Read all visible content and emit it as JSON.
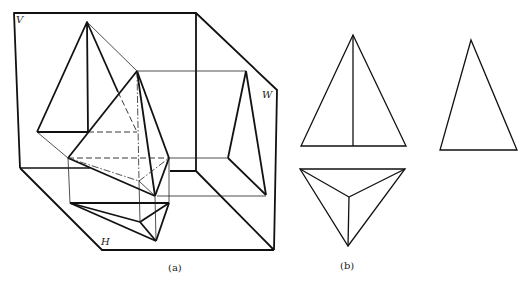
{
  "figure": {
    "part_a": {
      "caption": "(a)",
      "plane_labels": {
        "v": "V",
        "h": "H",
        "w": "W"
      }
    },
    "part_b": {
      "caption": "(b)",
      "views": [
        "front-view",
        "side-view",
        "top-view"
      ]
    }
  }
}
